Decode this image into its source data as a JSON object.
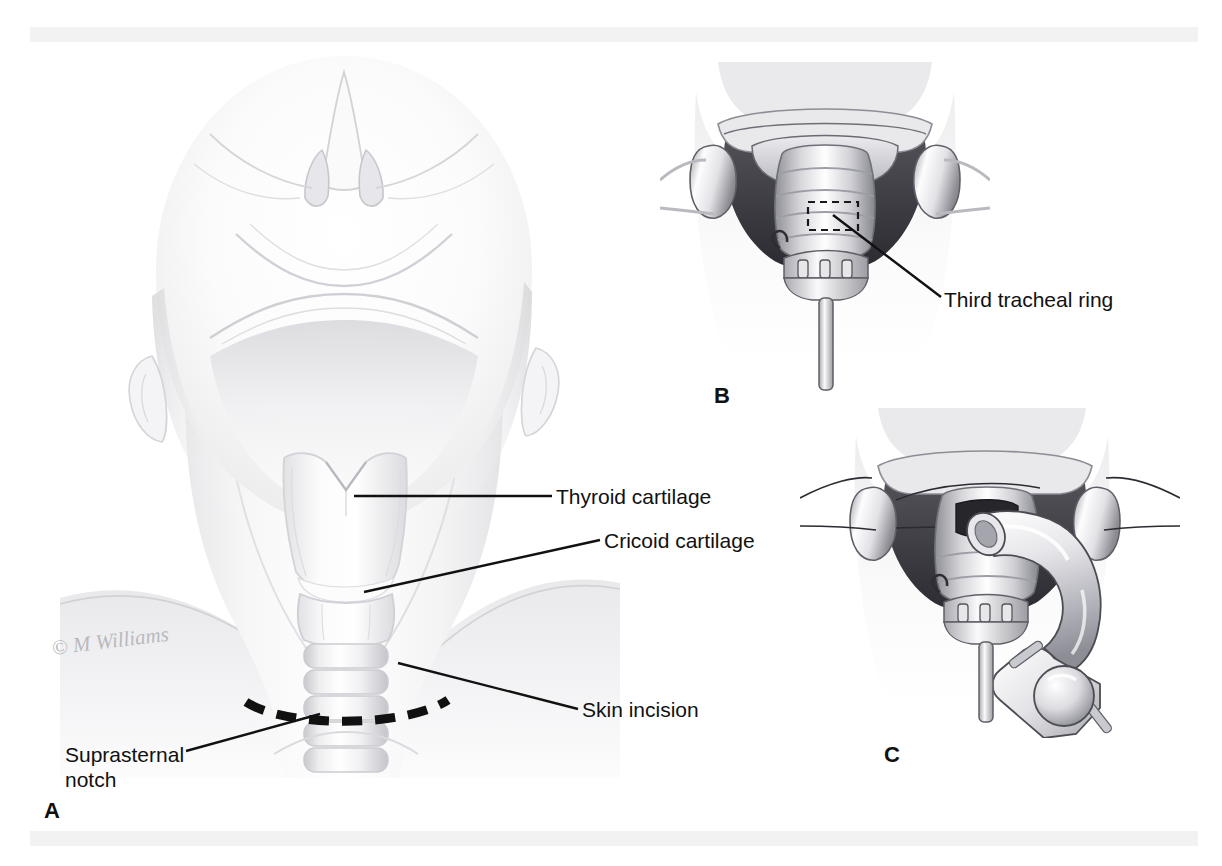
{
  "figure": {
    "background_color": "#ffffff",
    "band_color": "#f2f2f2",
    "ink_color": "#111111",
    "signature": "© M Williams"
  },
  "panels": [
    {
      "id": "A",
      "letter": "A",
      "name": "surface-anatomy-of-the-extended-neck",
      "description": "Head extended with neck exposed showing laryngeal and tracheal landmarks and the planned skin incision"
    },
    {
      "id": "B",
      "letter": "B",
      "name": "exposed-trachea-with-retractors",
      "description": "Operative exposure of the trachea with lateral retractors and a rake retractor; dashed box marks the incision site"
    },
    {
      "id": "C",
      "letter": "C",
      "name": "tracheostomy-tube-insertion",
      "description": "Tracheostomy tube with obturator being inserted through the tracheal window"
    }
  ],
  "labels": {
    "thyroid_cartilage": "Thyroid cartilage",
    "cricoid_cartilage": "Cricoid cartilage",
    "skin_incision": "Skin incision",
    "suprasternal_notch_line1": "Suprasternal",
    "suprasternal_notch_line2": "notch",
    "third_tracheal_ring": "Third tracheal ring"
  }
}
